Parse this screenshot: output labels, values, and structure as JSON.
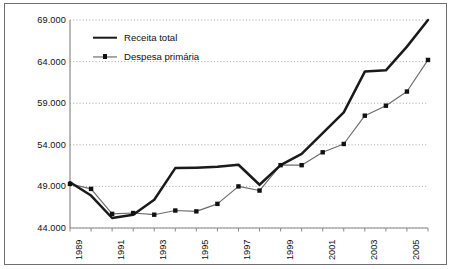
{
  "chart_data": {
    "type": "line",
    "title": "",
    "xlabel": "",
    "ylabel": "",
    "x": [
      1989,
      1990,
      1991,
      1992,
      1993,
      1994,
      1995,
      1996,
      1997,
      1998,
      1999,
      2000,
      2001,
      2002,
      2003,
      2004,
      2005,
      2006
    ],
    "categories": [
      "1989",
      "1990",
      "1991",
      "1992",
      "1993",
      "1994",
      "1995",
      "1996",
      "1997",
      "1998",
      "1999",
      "2000",
      "2001",
      "2002",
      "2003",
      "2004",
      "2005",
      "2006"
    ],
    "tick_labels_visible": [
      "1989",
      "",
      "1991",
      "",
      "1993",
      "",
      "1995",
      "",
      "1997",
      "",
      "1999",
      "",
      "2001",
      "",
      "2003",
      "",
      "2005",
      ""
    ],
    "ylim": [
      44000,
      69000
    ],
    "xlim": [
      1989,
      2006
    ],
    "yticks": [
      44000,
      49000,
      54000,
      59000,
      64000,
      69000
    ],
    "ytick_labels": [
      "44.000",
      "49.000",
      "54.000",
      "59.000",
      "64.000",
      "69.000"
    ],
    "grid": true,
    "grid_style": "dotted-horizontal",
    "legend_position": "top-left inside",
    "series": [
      {
        "name": "Receita total",
        "style": "thick-solid-line",
        "markers": false,
        "color": "#1a1a1a",
        "values": [
          49500,
          47900,
          45200,
          45600,
          47400,
          51200,
          51250,
          51350,
          51600,
          49200,
          51550,
          52900,
          55400,
          57900,
          62800,
          62950,
          65800,
          69000
        ]
      },
      {
        "name": "Despesa primária",
        "style": "thin-line-with-square-markers",
        "markers": true,
        "color": "#6b6b6b",
        "marker_color": "#111111",
        "values": [
          49300,
          48700,
          45700,
          45800,
          45600,
          46100,
          46000,
          46900,
          49000,
          48500,
          51550,
          51550,
          53100,
          54100,
          57500,
          58700,
          60400,
          64200
        ]
      }
    ]
  },
  "legend": {
    "items": [
      {
        "label": "Receita total",
        "swatch": "thick-line-swatch"
      },
      {
        "label": "Despesa primária",
        "swatch": "thin-line-marker-swatch"
      }
    ]
  },
  "colors": {
    "receita_line": "#1a1a1a",
    "despesa_line": "#6b6b6b",
    "despesa_marker": "#111111",
    "grid": "#9a9a9a",
    "axis": "#8a8a8a",
    "frame": "#6e6e6e",
    "background": "#ffffff"
  }
}
